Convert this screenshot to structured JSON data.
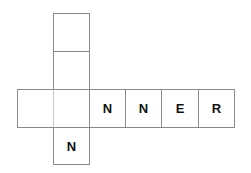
{
  "puzzle": {
    "type": "crossword-grid",
    "vertical": {
      "cells": [
        "",
        "",
        "",
        "N"
      ]
    },
    "horizontal": {
      "cells": [
        "",
        "",
        "N",
        "N",
        "E",
        "R"
      ]
    }
  }
}
